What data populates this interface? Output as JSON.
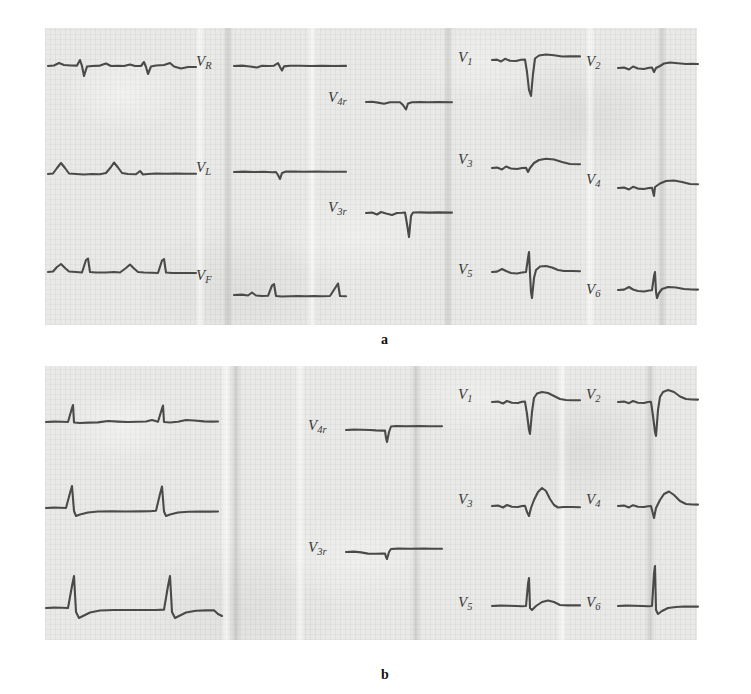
{
  "figure": {
    "type": "scanned-ecg-figure",
    "panels": [
      {
        "id": "a",
        "caption": "a",
        "leads": [
          {
            "label": "V",
            "sub": "R"
          },
          {
            "label": "V",
            "sub": "L"
          },
          {
            "label": "V",
            "sub": "F"
          },
          {
            "label": "V",
            "sub": "4r"
          },
          {
            "label": "V",
            "sub": "3r"
          },
          {
            "label": "V",
            "sub": "1"
          },
          {
            "label": "V",
            "sub": "2"
          },
          {
            "label": "V",
            "sub": "3"
          },
          {
            "label": "V",
            "sub": "4"
          },
          {
            "label": "V",
            "sub": "5"
          },
          {
            "label": "V",
            "sub": "6"
          }
        ]
      },
      {
        "id": "b",
        "caption": "b",
        "leads": [
          {
            "label": "V",
            "sub": "4r"
          },
          {
            "label": "V",
            "sub": "3r"
          },
          {
            "label": "V",
            "sub": "1"
          },
          {
            "label": "V",
            "sub": "2"
          },
          {
            "label": "V",
            "sub": "3"
          },
          {
            "label": "V",
            "sub": "4"
          },
          {
            "label": "V",
            "sub": "5"
          },
          {
            "label": "V",
            "sub": "6"
          }
        ]
      }
    ],
    "colors": {
      "paper": "#e9e9e7",
      "trace": "#4a4a4a",
      "label": "#3a3a3a",
      "caption": "#111111",
      "background": "#ffffff"
    }
  }
}
